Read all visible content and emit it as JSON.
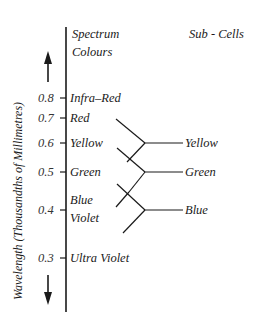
{
  "diagram": {
    "axis_title": "Wavelength (Thousandths of Millimetres)",
    "column_headers": {
      "spectrum_line1": "Spectrum",
      "spectrum_line2": "Colours",
      "subcells": "Sub - Cells"
    },
    "ticks": [
      {
        "value": "0.8",
        "label": "Infra–Red"
      },
      {
        "value": "0.7",
        "label": "Red"
      },
      {
        "value": "0.6",
        "label": "Yellow"
      },
      {
        "value": "0.5",
        "label": "Green"
      },
      {
        "value": "0.4",
        "label_line1": "Blue",
        "label_line2": "Violet"
      },
      {
        "value": "0.3",
        "label": "Ultra Violet"
      }
    ],
    "subcells": [
      {
        "label": "Yellow"
      },
      {
        "label": "Green"
      },
      {
        "label": "Blue"
      }
    ],
    "arrows": {
      "up": "arrow-up",
      "down": "arrow-down"
    },
    "colors": {
      "ink": "#1a1a1a",
      "background": "#ffffff"
    }
  }
}
